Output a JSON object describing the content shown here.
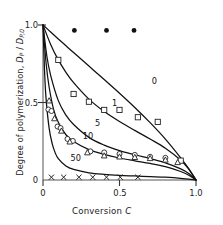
{
  "figure": {
    "name": "degree-of-polymerization-vs-conversion",
    "background": "#ffffff",
    "ink": "#1a1a1a"
  },
  "axes": {
    "x": {
      "label_prefix": "Conversion ",
      "label_symbol": "C",
      "ticks": [
        "0",
        "0.5",
        "1.0"
      ],
      "tick_values": [
        0,
        0.5,
        1.0
      ],
      "range": [
        0,
        1.0
      ]
    },
    "y": {
      "label_prefix": "Degree of polymerization, ",
      "label_symbol_a": "D",
      "label_sub_a": "P",
      "label_slash": " / ",
      "label_symbol_b": "D",
      "label_sub_b": "P,0",
      "ticks": [
        "0",
        "0.5",
        "1.0"
      ],
      "tick_values": [
        0,
        0.5,
        1.0
      ],
      "range": [
        0,
        1.0
      ]
    }
  },
  "chart_data": {
    "type": "line",
    "title": "",
    "xlabel": "Conversion C",
    "ylabel": "Degree of polymerization, DP / DP,0",
    "xlim": [
      0,
      1.0
    ],
    "ylim": [
      0,
      1.0
    ],
    "grid": false,
    "legend": "inline-curve-labels",
    "series": [
      {
        "name": "0",
        "label": "0",
        "label_at": {
          "x": 0.73,
          "y": 0.64
        },
        "marker": "none",
        "x": [
          0,
          0.05,
          0.1,
          0.15,
          0.2,
          0.3,
          0.4,
          0.5,
          0.6,
          0.7,
          0.8,
          0.9,
          0.95,
          1.0
        ],
        "y": [
          1.0,
          0.955,
          0.91,
          0.866,
          0.822,
          0.735,
          0.648,
          0.56,
          0.468,
          0.37,
          0.264,
          0.143,
          0.076,
          0.0
        ]
      },
      {
        "name": "1",
        "label": "1",
        "label_at": {
          "x": 0.47,
          "y": 0.5
        },
        "marker": "square-open",
        "x": [
          0,
          0.05,
          0.1,
          0.15,
          0.2,
          0.3,
          0.4,
          0.5,
          0.6,
          0.7,
          0.8,
          0.9,
          0.95,
          1.0
        ],
        "y": [
          1.0,
          0.875,
          0.775,
          0.695,
          0.628,
          0.522,
          0.442,
          0.378,
          0.32,
          0.264,
          0.205,
          0.128,
          0.074,
          0.0
        ],
        "marker_points": [
          {
            "x": 0.1,
            "y": 0.775
          },
          {
            "x": 0.2,
            "y": 0.555
          },
          {
            "x": 0.3,
            "y": 0.505
          },
          {
            "x": 0.4,
            "y": 0.452
          },
          {
            "x": 0.5,
            "y": 0.452
          },
          {
            "x": 0.62,
            "y": 0.405
          },
          {
            "x": 0.75,
            "y": 0.375
          },
          {
            "x": 0.9,
            "y": 0.125
          }
        ]
      },
      {
        "name": "5",
        "label": "5",
        "label_at": {
          "x": 0.36,
          "y": 0.365
        },
        "marker": "circle-open",
        "x": [
          0,
          0.025,
          0.05,
          0.1,
          0.15,
          0.2,
          0.3,
          0.4,
          0.5,
          0.6,
          0.7,
          0.8,
          0.9,
          0.95,
          1.0
        ],
        "y": [
          1.0,
          0.8,
          0.675,
          0.512,
          0.418,
          0.358,
          0.275,
          0.225,
          0.19,
          0.163,
          0.138,
          0.111,
          0.072,
          0.044,
          0.0
        ],
        "marker_points": [
          {
            "x": 0.035,
            "y": 0.455
          },
          {
            "x": 0.055,
            "y": 0.445
          },
          {
            "x": 0.095,
            "y": 0.345
          },
          {
            "x": 0.115,
            "y": 0.335
          },
          {
            "x": 0.16,
            "y": 0.265
          },
          {
            "x": 0.195,
            "y": 0.252
          },
          {
            "x": 0.31,
            "y": 0.185
          },
          {
            "x": 0.4,
            "y": 0.178
          },
          {
            "x": 0.5,
            "y": 0.168
          },
          {
            "x": 0.6,
            "y": 0.162
          },
          {
            "x": 0.7,
            "y": 0.15
          },
          {
            "x": 0.8,
            "y": 0.143
          }
        ]
      },
      {
        "name": "10",
        "label": "10",
        "label_at": {
          "x": 0.28,
          "y": 0.285
        },
        "marker": "triangle-open",
        "x": [
          0,
          0.02,
          0.04,
          0.07,
          0.1,
          0.15,
          0.2,
          0.3,
          0.4,
          0.5,
          0.6,
          0.7,
          0.8,
          0.9,
          0.95,
          1.0
        ],
        "y": [
          1.0,
          0.755,
          0.6,
          0.452,
          0.372,
          0.292,
          0.248,
          0.196,
          0.165,
          0.142,
          0.124,
          0.107,
          0.086,
          0.055,
          0.032,
          0.0
        ],
        "marker_points": [
          {
            "x": 0.04,
            "y": 0.51
          },
          {
            "x": 0.075,
            "y": 0.395
          },
          {
            "x": 0.12,
            "y": 0.315
          },
          {
            "x": 0.175,
            "y": 0.245
          },
          {
            "x": 0.29,
            "y": 0.175
          },
          {
            "x": 0.4,
            "y": 0.155
          },
          {
            "x": 0.5,
            "y": 0.148
          },
          {
            "x": 0.6,
            "y": 0.145
          },
          {
            "x": 0.7,
            "y": 0.138
          },
          {
            "x": 0.8,
            "y": 0.128
          },
          {
            "x": 0.88,
            "y": 0.112
          }
        ]
      },
      {
        "name": "50",
        "label": "50",
        "label_at": {
          "x": 0.2,
          "y": 0.145
        },
        "marker": "x",
        "x": [
          0,
          0.01,
          0.02,
          0.04,
          0.06,
          0.08,
          0.1,
          0.15,
          0.2,
          0.3,
          0.4,
          0.5,
          0.6,
          0.7,
          0.8,
          0.9,
          1.0
        ],
        "y": [
          1.0,
          0.705,
          0.525,
          0.335,
          0.235,
          0.175,
          0.138,
          0.09,
          0.068,
          0.046,
          0.036,
          0.03,
          0.026,
          0.022,
          0.018,
          0.011,
          0.0
        ],
        "marker_points": [
          {
            "x": 0.055,
            "y": 0.018
          },
          {
            "x": 0.135,
            "y": 0.018
          },
          {
            "x": 0.235,
            "y": 0.018
          },
          {
            "x": 0.325,
            "y": 0.018
          },
          {
            "x": 0.415,
            "y": 0.018
          },
          {
            "x": 0.505,
            "y": 0.018
          },
          {
            "x": 0.62,
            "y": 0.018
          }
        ]
      },
      {
        "name": "filled-circles",
        "label": "",
        "marker": "circle-filled",
        "marker_points": [
          {
            "x": 0.205,
            "y": 0.965
          },
          {
            "x": 0.415,
            "y": 0.965
          },
          {
            "x": 0.595,
            "y": 0.965
          }
        ]
      }
    ]
  }
}
